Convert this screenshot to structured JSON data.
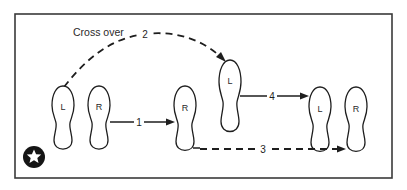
{
  "diagram": {
    "type": "footwork-step-sequence",
    "caption": "Cross over",
    "start_marker": "star-in-circle",
    "colors": {
      "ink": "#1e1e1e",
      "frame": "#3a3a3a",
      "background": "#ffffff"
    },
    "feet": [
      {
        "id": "foot-1",
        "label": "L",
        "side": "left",
        "position": "start"
      },
      {
        "id": "foot-2",
        "label": "R",
        "side": "right",
        "position": "start"
      },
      {
        "id": "foot-3",
        "label": "R",
        "side": "right",
        "position": "after-step-1"
      },
      {
        "id": "foot-4",
        "label": "L",
        "side": "left",
        "position": "after-step-2"
      },
      {
        "id": "foot-5",
        "label": "L",
        "side": "left",
        "position": "end"
      },
      {
        "id": "foot-6",
        "label": "R",
        "side": "right",
        "position": "end"
      }
    ],
    "steps": [
      {
        "number": "1",
        "style": "solid",
        "from": "foot-2",
        "to": "foot-3"
      },
      {
        "number": "2",
        "style": "dashed",
        "from": "foot-1",
        "to": "foot-4",
        "note": "Cross over"
      },
      {
        "number": "3",
        "style": "dashed",
        "from": "foot-3",
        "to": "foot-6"
      },
      {
        "number": "4",
        "style": "solid",
        "from": "foot-4",
        "to": "foot-5"
      }
    ]
  }
}
